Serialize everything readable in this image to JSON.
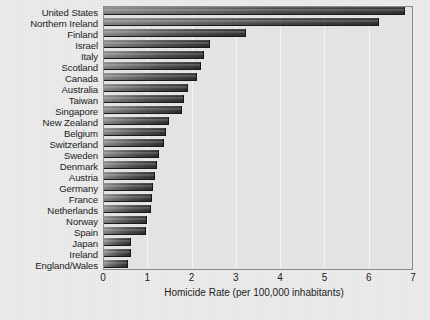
{
  "chart_data": {
    "type": "bar",
    "orientation": "horizontal",
    "title": "",
    "xlabel": "Homicide Rate (per 100,000 inhabitants)",
    "ylabel": "",
    "xlim": [
      0,
      7
    ],
    "xticks": [
      0,
      1,
      2,
      3,
      4,
      5,
      6,
      7
    ],
    "grid": true,
    "legend": "none",
    "categories": [
      "United States",
      "Northern Ireland",
      "Finland",
      "Israel",
      "Italy",
      "Scotland",
      "Canada",
      "Australia",
      "Taiwan",
      "Singapore",
      "New Zealand",
      "Belgium",
      "Switzerland",
      "Sweden",
      "Denmark",
      "Austria",
      "Germany",
      "France",
      "Netherlands",
      "Norway",
      "Spain",
      "Japan",
      "Ireland",
      "England/Wales"
    ],
    "values": [
      6.8,
      6.2,
      3.2,
      2.4,
      2.25,
      2.2,
      2.1,
      1.9,
      1.8,
      1.75,
      1.47,
      1.4,
      1.35,
      1.25,
      1.2,
      1.15,
      1.1,
      1.08,
      1.05,
      0.97,
      0.95,
      0.62,
      0.6,
      0.55
    ]
  },
  "style": {
    "page_background": "#e9e9e9",
    "plot_background": "#e3e3e3",
    "frame_color": "#8c8c8c",
    "gridline_color": "#f4f4f4",
    "bar_color_light": "#8a8a8a",
    "bar_color_dark": "#2e2e2e",
    "text_color": "#1c1c1c"
  }
}
